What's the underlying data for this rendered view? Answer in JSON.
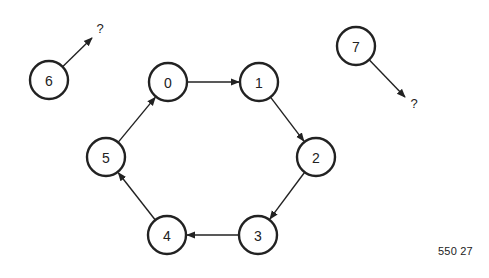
{
  "diagram": {
    "type": "directed-graph",
    "nodes": [
      {
        "id": "0",
        "label": "0",
        "x": 168,
        "y": 82
      },
      {
        "id": "1",
        "label": "1",
        "x": 259,
        "y": 82
      },
      {
        "id": "2",
        "label": "2",
        "x": 316,
        "y": 157
      },
      {
        "id": "3",
        "label": "3",
        "x": 258,
        "y": 235
      },
      {
        "id": "4",
        "label": "4",
        "x": 167,
        "y": 235
      },
      {
        "id": "5",
        "label": "5",
        "x": 106,
        "y": 157
      },
      {
        "id": "6",
        "label": "6",
        "x": 49,
        "y": 80
      },
      {
        "id": "7",
        "label": "7",
        "x": 356,
        "y": 46
      }
    ],
    "edges": [
      {
        "from": "0",
        "to": "1"
      },
      {
        "from": "1",
        "to": "2"
      },
      {
        "from": "2",
        "to": "3"
      },
      {
        "from": "3",
        "to": "4"
      },
      {
        "from": "4",
        "to": "5"
      },
      {
        "from": "5",
        "to": "0"
      }
    ],
    "dangling_edges": [
      {
        "from": "6",
        "to_label": "?",
        "end_x": 92,
        "end_y": 38,
        "label_x": 100,
        "label_y": 33
      },
      {
        "from": "7",
        "to_label": "?",
        "end_x": 405,
        "end_y": 97,
        "label_x": 414,
        "label_y": 108
      }
    ],
    "node_radius": 19,
    "figure_id": "550 27"
  }
}
